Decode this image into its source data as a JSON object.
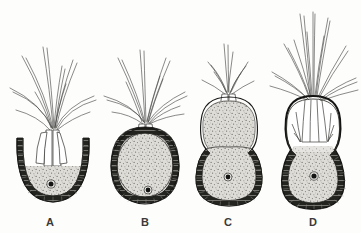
{
  "figure": {
    "type": "scientific-illustration",
    "background_color": "#fdfdfc",
    "ink_color": "#2b2b29",
    "wall_color": "#1d1d1b",
    "cytoplasm_color": "#d9d7d2",
    "panel_count": 4,
    "panels": [
      {
        "id": "A",
        "label": "A",
        "label_x": 50,
        "label_y": 226,
        "body_shape": "cup-shaped U with open top",
        "body_cx": 53,
        "body_cy": 172,
        "body_rx": 36,
        "body_ry": 31,
        "has_nucleus": true,
        "nucleus_x": 51,
        "nucleus_y": 184,
        "filament_count": 9,
        "tuft_height": 95,
        "upper_chamber_stippled": false,
        "lower_chamber_stippled": true
      },
      {
        "id": "B",
        "label": "B",
        "label_x": 145,
        "label_y": 226,
        "body_shape": "broad ovoid",
        "body_cx": 145,
        "body_cy": 163,
        "body_rx": 34,
        "body_ry": 39,
        "has_nucleus": true,
        "nucleus_x": 148,
        "nucleus_y": 190,
        "filament_count": 9,
        "tuft_height": 100,
        "upper_chamber_stippled": false,
        "lower_chamber_stippled": true
      },
      {
        "id": "C",
        "label": "C",
        "label_x": 228,
        "label_y": 226,
        "body_shape": "peanut / figure-eight with waist",
        "body_cx": 229,
        "body_cy": 150,
        "body_rx": 31,
        "body_ry": 57,
        "has_nucleus": true,
        "nucleus_x": 228,
        "nucleus_y": 177,
        "filament_count": 7,
        "tuft_height": 60,
        "upper_chamber_stippled": true,
        "lower_chamber_stippled": true
      },
      {
        "id": "D",
        "label": "D",
        "label_x": 313,
        "label_y": 226,
        "body_shape": "peanut with clear upper chamber of tubes",
        "body_cx": 313,
        "body_cy": 150,
        "body_rx": 33,
        "body_ry": 60,
        "has_nucleus": true,
        "nucleus_x": 314,
        "nucleus_y": 176,
        "filament_count": 11,
        "tuft_height": 105,
        "upper_chamber_stippled": false,
        "lower_chamber_stippled": true
      }
    ]
  }
}
